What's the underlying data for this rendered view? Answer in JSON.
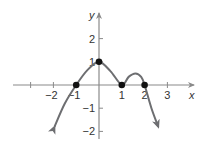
{
  "chart_data": {
    "type": "line",
    "title": "",
    "xlabel": "x",
    "ylabel": "y",
    "xlim": [
      -3.8,
      4.2
    ],
    "ylim": [
      -2.3,
      3.1
    ],
    "grid": false,
    "legend": null,
    "x_ticks": [
      -3,
      -2,
      -1,
      1,
      2,
      3
    ],
    "x_tick_labels": [
      "-2",
      "-1",
      "1",
      "2",
      "3"
    ],
    "x_tick_label_values": [
      -2,
      -1,
      1,
      2,
      3
    ],
    "y_ticks": [
      -2,
      -1,
      1,
      2
    ],
    "y_tick_labels": [
      "-2",
      "-1",
      "1",
      "2"
    ],
    "y_tick_label_values": [
      -2,
      -1,
      1,
      2
    ],
    "series": [
      {
        "name": "f(x)",
        "color": "#6d6e71",
        "arrows_at_ends": true,
        "points": [
          [
            -1.95,
            -1.8
          ],
          [
            -1.5,
            -0.8
          ],
          [
            -1.0,
            0.0
          ],
          [
            -0.5,
            0.65
          ],
          [
            0.0,
            1.0
          ],
          [
            0.5,
            0.6
          ],
          [
            1.0,
            0.0
          ],
          [
            1.3,
            0.35
          ],
          [
            1.6,
            0.5
          ],
          [
            1.85,
            0.35
          ],
          [
            2.0,
            0.0
          ],
          [
            2.3,
            -1.0
          ],
          [
            2.6,
            -1.8
          ]
        ]
      }
    ],
    "marked_points": [
      {
        "x": -1,
        "y": 0
      },
      {
        "x": 0,
        "y": 1
      },
      {
        "x": 1,
        "y": 0
      },
      {
        "x": 2,
        "y": 0
      }
    ]
  },
  "colors": {
    "curve": "#6d6e71",
    "axis": "#8a8a8a",
    "point": "#111111",
    "text": "#333333"
  }
}
